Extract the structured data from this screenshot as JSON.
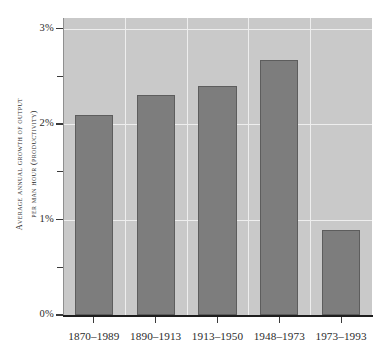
{
  "chart_data": {
    "type": "bar",
    "title": "",
    "subtitle": "",
    "xlabel": "",
    "ylabel_line1": "Average annual growth of output",
    "ylabel_line2": "per man hour (productivity)",
    "categories": [
      "1870–1989",
      "1890–1913",
      "1913–1950",
      "1948–1973",
      "1973–1993"
    ],
    "values": [
      2.1,
      2.3,
      2.4,
      2.67,
      0.89
    ],
    "value_unit": "%",
    "ylim": [
      0,
      3.11
    ],
    "ytick_values": [
      0,
      0.5,
      1,
      1.5,
      2,
      2.5,
      3
    ],
    "ytick_labels": [
      "0%",
      "",
      "1%",
      "",
      "2%",
      "",
      "3%"
    ],
    "grid": "horizontal and vertical white gridlines on gray panel",
    "legend": "none",
    "colors": {
      "bar_fill": "#7d7d7d",
      "bar_edge": "#5d5d5d",
      "panel_background": "#c9c9c9",
      "gridline": "#eeeeee",
      "axis": "#1d1d1d",
      "text": "#2b2b2b",
      "figure_background": "#ffffff"
    }
  }
}
